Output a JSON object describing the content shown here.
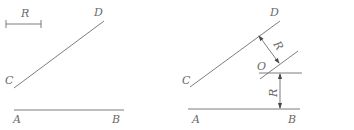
{
  "colors": {
    "line": "#6e6e6e",
    "text": "#6a6a6a",
    "arrow": "#444444",
    "background": "#ffffff"
  },
  "left_figure": {
    "scale_bar_label": "R",
    "labels": {
      "C": "C",
      "D": "D",
      "A": "A",
      "B": "B"
    }
  },
  "right_figure": {
    "labels": {
      "C": "C",
      "D": "D",
      "A": "A",
      "B": "B",
      "O": "O"
    },
    "dimension_labels": {
      "offset_from_CD": "R",
      "offset_from_AB": "R"
    }
  }
}
